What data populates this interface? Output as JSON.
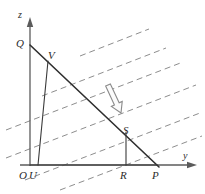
{
  "figure": {
    "width": 205,
    "height": 194,
    "background_color": "#ffffff"
  },
  "axes": {
    "vertical": {
      "name": "z",
      "label": "z",
      "label_x": 18,
      "label_y": 10,
      "x": 30,
      "y_bottom": 166,
      "y_top": 18,
      "color": "#5b5b5b"
    },
    "horizontal": {
      "name": "y",
      "label": "y",
      "label_x": 183,
      "label_y": 151,
      "y": 165,
      "x_left": 20,
      "x_right": 196,
      "color": "#5b5b5b"
    }
  },
  "points": [
    {
      "id": "Q",
      "label": "Q",
      "x": 30,
      "y": 45,
      "label_x": 16,
      "label_y": 38
    },
    {
      "id": "V",
      "label": "V",
      "x": 48,
      "y": 62,
      "label_x": 48,
      "label_y": 50
    },
    {
      "id": "S",
      "label": "S",
      "x": 126,
      "y": 133,
      "label_x": 123,
      "label_y": 125
    },
    {
      "id": "O",
      "label": "O",
      "x": 30,
      "y": 165,
      "label_x": 19,
      "label_y": 170
    },
    {
      "id": "U",
      "label": "U",
      "x": 38,
      "y": 165,
      "label_x": 29,
      "label_y": 170
    },
    {
      "id": "R",
      "label": "R",
      "x": 126,
      "y": 165,
      "label_x": 120,
      "label_y": 170
    },
    {
      "id": "P",
      "label": "P",
      "x": 157,
      "y": 165,
      "label_x": 152,
      "label_y": 170
    }
  ],
  "segments": [
    {
      "id": "QP",
      "name": "hypotenuse-QP",
      "x1": 30,
      "y1": 45,
      "x2": 159,
      "y2": 167,
      "weight": "thick"
    },
    {
      "id": "UV",
      "name": "segment-UV",
      "x1": 38,
      "y1": 165,
      "x2": 48,
      "y2": 61,
      "weight": "thin"
    },
    {
      "id": "RS",
      "name": "segment-RS",
      "x1": 126,
      "y1": 165,
      "x2": 126,
      "y2": 132,
      "weight": "thin"
    },
    {
      "id": "OR",
      "name": "segment-base",
      "x1": 30,
      "y1": 165,
      "x2": 157,
      "y2": 165,
      "weight": "thin"
    }
  ],
  "dashed_lines": {
    "name": "parallel-dashed-family",
    "color": "#8d8d8d",
    "slope": -0.385,
    "dash_pattern": "6 4",
    "count": 6,
    "lines": [
      {
        "x1": 80,
        "y1": 56,
        "x2": 149,
        "y2": 29
      },
      {
        "x1": 42,
        "y1": 96,
        "x2": 166,
        "y2": 48
      },
      {
        "x1": 6,
        "y1": 130,
        "x2": 183,
        "y2": 62
      },
      {
        "x1": 6,
        "y1": 158,
        "x2": 196,
        "y2": 85
      },
      {
        "x1": 25,
        "y1": 180,
        "x2": 200,
        "y2": 113
      },
      {
        "x1": 60,
        "y1": 190,
        "x2": 202,
        "y2": 136
      }
    ]
  },
  "block_arrow": {
    "name": "direction-arrow",
    "description": "hollow block arrow pointing down-right",
    "tail_x": 108,
    "tail_y": 85,
    "tip_x": 121,
    "tip_y": 113,
    "fill": "#fbfbfb",
    "stroke": "#8a8a8a"
  }
}
